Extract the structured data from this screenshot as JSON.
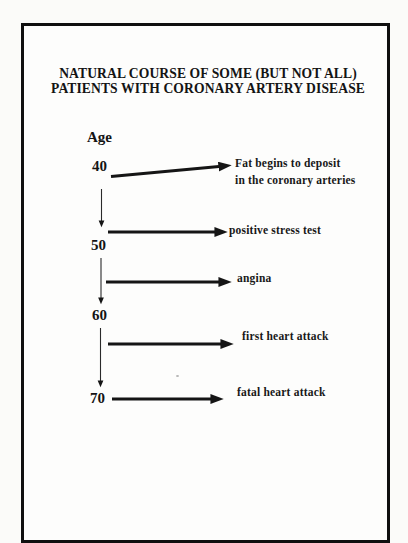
{
  "page": {
    "background": "#fbfbf9",
    "paper": "#fdfdfc",
    "ink": "#141414",
    "frame_border": "#0f0f0f"
  },
  "title": {
    "line1": "NATURAL COURSE OF SOME (BUT NOT ALL)",
    "line2": "PATIENTS WITH CORONARY ARTERY DISEASE"
  },
  "axis_label": "Age",
  "timeline": {
    "ages": [
      "40",
      "50",
      "60",
      "70"
    ],
    "events": [
      {
        "line1": "Fat begins to deposit",
        "line2": "in the coronary arteries"
      },
      {
        "line1": "positive stress test"
      },
      {
        "line1": "angina"
      },
      {
        "line1": "first heart attack"
      },
      {
        "line1": "fatal heart attack"
      }
    ]
  }
}
